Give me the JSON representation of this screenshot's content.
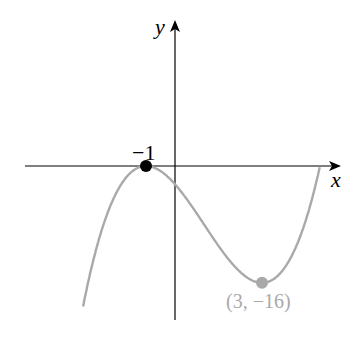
{
  "chart_data": {
    "type": "line",
    "title": "",
    "xlabel": "x",
    "ylabel": "y",
    "function": "f(x) = (x+1)^2 (x-5) / 2",
    "series": [
      {
        "name": "f(x)",
        "color": "#a9a9a9",
        "x": [
          -3.2,
          -3,
          -2,
          -1,
          0,
          1,
          2,
          3,
          4,
          5
        ],
        "values": [
          -18.9,
          -16,
          -3.5,
          0,
          -2.5,
          -8,
          -13.5,
          -16,
          -12.5,
          0
        ]
      }
    ],
    "points": [
      {
        "x": -1,
        "y": 0,
        "label": "−1",
        "color": "#000000"
      },
      {
        "x": 3,
        "y": -16,
        "label": "(3, −16)",
        "color": "#a9a9a9"
      }
    ],
    "axes": {
      "x_label": "x",
      "y_label": "y"
    },
    "grid": false
  }
}
